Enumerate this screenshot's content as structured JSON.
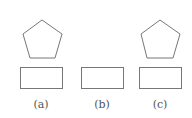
{
  "figures": [
    {
      "id": "a",
      "label": "(a)",
      "has_pentagon": true,
      "has_rectangle": true
    },
    {
      "id": "b",
      "label": "(b)",
      "has_pentagon": false,
      "has_rectangle": true
    },
    {
      "id": "c",
      "label": "(c)",
      "has_pentagon": true,
      "has_rectangle": true
    }
  ],
  "colors": {
    "stroke": "#777777",
    "label": "#555555",
    "background": "#ffffff"
  }
}
